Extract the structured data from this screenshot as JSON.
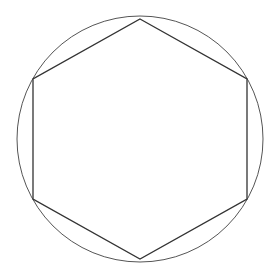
{
  "diagram": {
    "canvas": {
      "width": 278,
      "height": 272,
      "background": "#ffffff"
    },
    "circle": {
      "cx": 140,
      "cy": 139,
      "r": 123,
      "stroke": "#555555",
      "stroke_width": 1
    },
    "hexagon": {
      "points": [
        [
          140,
          19
        ],
        [
          247,
          79
        ],
        [
          247,
          199
        ],
        [
          140,
          259
        ],
        [
          33,
          199
        ],
        [
          33,
          79
        ]
      ],
      "stroke": "#333333",
      "stroke_width": 1.3
    }
  }
}
